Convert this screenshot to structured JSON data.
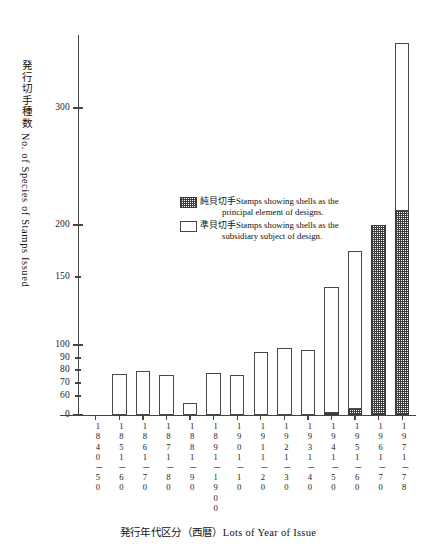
{
  "chart_data": {
    "type": "bar",
    "title": "",
    "xlabel": "発行年代区分（西暦）Lots of Year of Issue",
    "ylabel": "発行切手種数 No. of Species of Stamps Issued",
    "grid": false,
    "legend_position": "inside-upper-right",
    "stacked": true,
    "ylim": [
      0,
      340
    ],
    "yticks": [
      0,
      60,
      70,
      80,
      90,
      100,
      150,
      200,
      300
    ],
    "ytick_labels": [
      "0",
      "60",
      "70",
      "80",
      "90",
      "100",
      "150",
      "200",
      "300"
    ],
    "y_axis_note": "broken non-linear scale: 0-60 compressed, 60-100 expanded",
    "categories": [
      "1840－50",
      "1851－60",
      "1861－70",
      "1871－80",
      "1881－90",
      "1891－1900",
      "1901－10",
      "1911－20",
      "1921－30",
      "1931－40",
      "1941－50",
      "1951－60",
      "1961－70",
      "1971－78"
    ],
    "series": [
      {
        "name": "準貝切手 Stamps showing shells as the subsidiary subject of design.",
        "key": "subsidiary",
        "fill": "white",
        "values": [
          0,
          77,
          79,
          76,
          39,
          78,
          76,
          95,
          98,
          96,
          137,
          155,
          0,
          125
        ]
      },
      {
        "name": "純貝切手 Stamps showing shells as the principal element of designs.",
        "key": "principal",
        "fill": "hatched",
        "values": [
          0,
          0,
          0,
          0,
          0,
          0,
          0,
          0,
          0,
          0,
          6,
          20,
          200,
          212
        ]
      }
    ],
    "totals": [
      0,
      77,
      79,
      76,
      39,
      78,
      76,
      95,
      98,
      96,
      143,
      175,
      200,
      337
    ]
  },
  "axis": {
    "y_title": "発行切手種数 No. of Species of Stamps Issued",
    "x_title": "発行年代区分（西暦）Lots of Year of Issue"
  },
  "legend": {
    "items": [
      {
        "swatch": "hatched",
        "jp": "純貝切手",
        "line1": "Stamps showing shells as the",
        "line2": "principal element of designs."
      },
      {
        "swatch": "white",
        "jp": "準貝切手",
        "line1": "Stamps showing shells as the",
        "line2": "subsidiary subject of design."
      }
    ]
  },
  "colors": {
    "axis": "#444444",
    "bar_outline": "#4a4a4a",
    "hatch": "#3d3d3d",
    "background": "#ffffff",
    "text": "#111111"
  }
}
